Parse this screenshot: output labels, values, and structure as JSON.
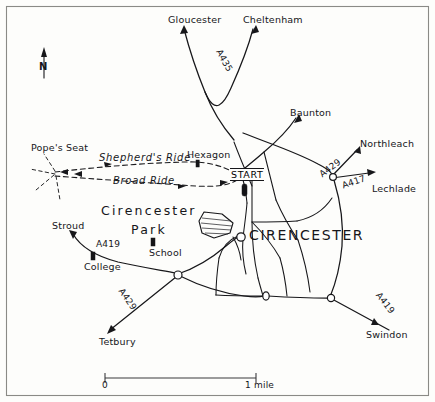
{
  "map": {
    "title_town": "CIRENCESTER",
    "park_label_line1": "Cirencester",
    "park_label_line2": "Park",
    "start_marker": "START",
    "north_letter": "N",
    "north_icon": "north-arrow-icon",
    "places": [
      {
        "name": "Gloucester",
        "x": 168,
        "y": 15
      },
      {
        "name": "Cheltenham",
        "x": 243,
        "y": 15
      },
      {
        "name": "Baunton",
        "x": 290,
        "y": 108
      },
      {
        "name": "Northleach",
        "x": 362,
        "y": 140
      },
      {
        "name": "Lechlade",
        "x": 372,
        "y": 184
      },
      {
        "name": "Swindon",
        "x": 370,
        "y": 332
      },
      {
        "name": "Tetbury",
        "x": 100,
        "y": 338
      },
      {
        "name": "Stroud",
        "x": 55,
        "y": 222
      }
    ],
    "roads": [
      {
        "number": "A435",
        "x": 222,
        "y": 52
      },
      {
        "number": "A429",
        "x": 336,
        "y": 162
      },
      {
        "number": "A417",
        "x": 352,
        "y": 180
      },
      {
        "number": "A429",
        "x": 124,
        "y": 289
      },
      {
        "number": "A419",
        "x": 96,
        "y": 244
      },
      {
        "number": "A419",
        "x": 382,
        "y": 293
      }
    ],
    "features": [
      {
        "name": "Pope's Seat",
        "x": 33,
        "y": 147
      },
      {
        "name": "Hexagon",
        "x": 188,
        "y": 152
      },
      {
        "name": "School",
        "x": 152,
        "y": 249
      },
      {
        "name": "College",
        "x": 86,
        "y": 264
      }
    ],
    "rides": [
      {
        "name": "Shepherd's Ride",
        "x": 98,
        "y": 157
      },
      {
        "name": "Broad Ride",
        "x": 113,
        "y": 177
      }
    ],
    "scale": {
      "start_label": "0",
      "end_label": "1 mile"
    }
  }
}
